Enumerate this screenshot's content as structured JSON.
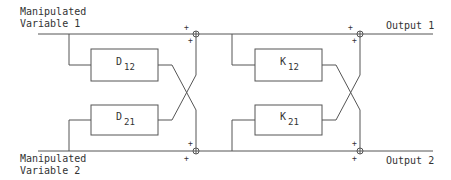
{
  "diagram": {
    "inputs": [
      {
        "line1": "Manipulated",
        "line2": "Variable 1"
      },
      {
        "line1": "Manipulated",
        "line2": "Variable 2"
      }
    ],
    "outputs": [
      {
        "label": "Output 1"
      },
      {
        "label": "Output 2"
      }
    ],
    "decoupler_blocks": [
      {
        "letter": "D",
        "subscript": "12"
      },
      {
        "letter": "D",
        "subscript": "21"
      }
    ],
    "process_blocks": [
      {
        "letter": "K",
        "subscript": "12"
      },
      {
        "letter": "K",
        "subscript": "21"
      }
    ],
    "summing_junction_signs": {
      "left_top": [
        "+",
        "+"
      ],
      "left_bottom": [
        "+",
        "+"
      ],
      "right_top": [
        "+",
        "+"
      ],
      "right_bottom": [
        "+",
        "+"
      ]
    },
    "colors": {
      "line": "#555555",
      "text": "#333333",
      "background": "#ffffff"
    }
  }
}
